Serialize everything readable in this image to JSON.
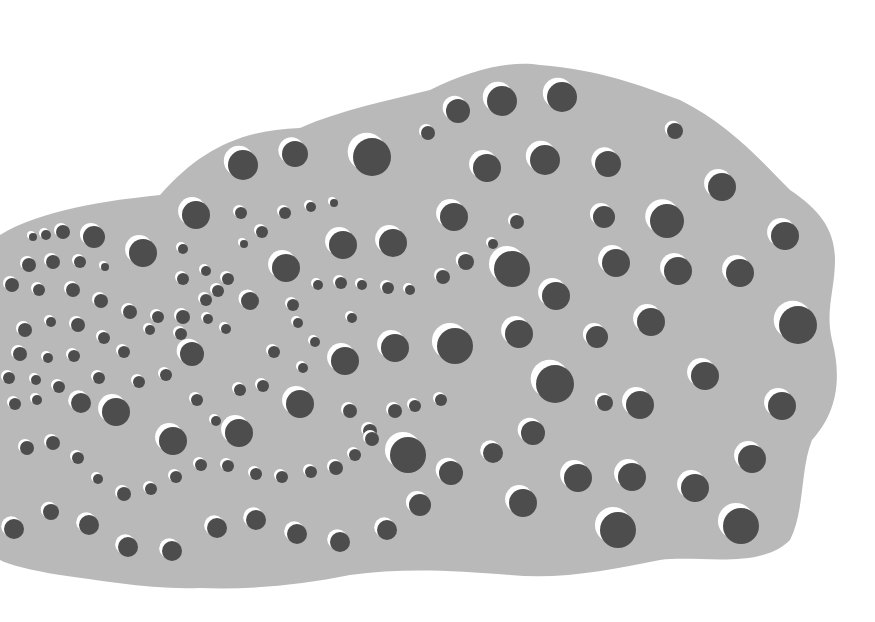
{
  "image": {
    "description": "Abstract gray cloud-shaped blob filled with dark dots, each with a white crescent highlight offset to the upper-left",
    "colors": {
      "background": "#ffffff",
      "blob": "#b9b9b9",
      "dot": "#4d4d4d",
      "highlight": "#ffffff"
    }
  },
  "dots": [
    [
      243,
      165,
      15
    ],
    [
      295,
      154,
      13
    ],
    [
      372,
      157,
      19
    ],
    [
      458,
      111,
      12
    ],
    [
      502,
      101,
      15
    ],
    [
      562,
      97,
      15
    ],
    [
      675,
      131,
      8
    ],
    [
      428,
      133,
      7
    ],
    [
      487,
      168,
      14
    ],
    [
      545,
      160,
      15
    ],
    [
      608,
      164,
      13
    ],
    [
      722,
      187,
      14
    ],
    [
      785,
      236,
      14
    ],
    [
      196,
      215,
      14
    ],
    [
      94,
      237,
      11
    ],
    [
      143,
      253,
      14
    ],
    [
      241,
      213,
      6
    ],
    [
      285,
      213,
      6
    ],
    [
      311,
      207,
      5
    ],
    [
      334,
      203,
      4
    ],
    [
      454,
      217,
      14
    ],
    [
      517,
      222,
      7
    ],
    [
      604,
      217,
      11
    ],
    [
      667,
      221,
      17
    ],
    [
      33,
      237,
      4
    ],
    [
      46,
      235,
      5
    ],
    [
      63,
      232,
      7
    ],
    [
      343,
      245,
      14
    ],
    [
      393,
      243,
      14
    ],
    [
      493,
      244,
      5
    ],
    [
      512,
      269,
      18
    ],
    [
      616,
      263,
      14
    ],
    [
      678,
      271,
      14
    ],
    [
      740,
      273,
      14
    ],
    [
      286,
      268,
      14
    ],
    [
      244,
      244,
      4
    ],
    [
      262,
      232,
      6
    ],
    [
      183,
      249,
      5
    ],
    [
      183,
      279,
      6
    ],
    [
      206,
      271,
      5
    ],
    [
      228,
      279,
      6
    ],
    [
      29,
      265,
      7
    ],
    [
      53,
      262,
      7
    ],
    [
      80,
      262,
      6
    ],
    [
      105,
      267,
      4
    ],
    [
      12,
      285,
      7
    ],
    [
      39,
      290,
      6
    ],
    [
      73,
      290,
      7
    ],
    [
      101,
      301,
      7
    ],
    [
      130,
      312,
      7
    ],
    [
      158,
      317,
      6
    ],
    [
      183,
      317,
      7
    ],
    [
      206,
      300,
      6
    ],
    [
      218,
      291,
      6
    ],
    [
      250,
      301,
      9
    ],
    [
      293,
      305,
      6
    ],
    [
      318,
      285,
      5
    ],
    [
      341,
      283,
      6
    ],
    [
      362,
      285,
      5
    ],
    [
      388,
      288,
      6
    ],
    [
      410,
      290,
      5
    ],
    [
      443,
      277,
      7
    ],
    [
      466,
      262,
      8
    ],
    [
      556,
      296,
      14
    ],
    [
      798,
      325,
      19
    ],
    [
      651,
      322,
      14
    ],
    [
      597,
      337,
      11
    ],
    [
      519,
      334,
      14
    ],
    [
      455,
      346,
      18
    ],
    [
      395,
      348,
      14
    ],
    [
      345,
      361,
      14
    ],
    [
      298,
      323,
      5
    ],
    [
      352,
      318,
      5
    ],
    [
      226,
      329,
      5
    ],
    [
      208,
      319,
      5
    ],
    [
      181,
      334,
      6
    ],
    [
      192,
      354,
      12
    ],
    [
      25,
      330,
      7
    ],
    [
      51,
      322,
      5
    ],
    [
      78,
      325,
      7
    ],
    [
      104,
      338,
      6
    ],
    [
      20,
      354,
      7
    ],
    [
      48,
      358,
      5
    ],
    [
      74,
      356,
      6
    ],
    [
      150,
      330,
      5
    ],
    [
      124,
      352,
      6
    ],
    [
      274,
      352,
      6
    ],
    [
      303,
      368,
      5
    ],
    [
      315,
      342,
      5
    ],
    [
      9,
      378,
      6
    ],
    [
      36,
      380,
      5
    ],
    [
      59,
      387,
      6
    ],
    [
      99,
      378,
      6
    ],
    [
      139,
      382,
      6
    ],
    [
      166,
      375,
      6
    ],
    [
      197,
      400,
      6
    ],
    [
      240,
      390,
      6
    ],
    [
      263,
      386,
      6
    ],
    [
      300,
      404,
      14
    ],
    [
      350,
      411,
      7
    ],
    [
      370,
      431,
      7
    ],
    [
      395,
      411,
      7
    ],
    [
      415,
      406,
      6
    ],
    [
      441,
      400,
      6
    ],
    [
      408,
      455,
      18
    ],
    [
      555,
      384,
      19
    ],
    [
      605,
      403,
      8
    ],
    [
      640,
      405,
      14
    ],
    [
      705,
      376,
      14
    ],
    [
      782,
      406,
      14
    ],
    [
      533,
      433,
      12
    ],
    [
      493,
      453,
      10
    ],
    [
      752,
      459,
      14
    ],
    [
      15,
      404,
      6
    ],
    [
      37,
      400,
      5
    ],
    [
      81,
      403,
      10
    ],
    [
      116,
      412,
      14
    ],
    [
      173,
      441,
      14
    ],
    [
      239,
      433,
      14
    ],
    [
      216,
      421,
      5
    ],
    [
      27,
      448,
      7
    ],
    [
      53,
      443,
      7
    ],
    [
      78,
      458,
      6
    ],
    [
      98,
      479,
      5
    ],
    [
      124,
      494,
      7
    ],
    [
      151,
      489,
      6
    ],
    [
      176,
      477,
      6
    ],
    [
      201,
      465,
      6
    ],
    [
      228,
      466,
      6
    ],
    [
      256,
      474,
      6
    ],
    [
      282,
      477,
      6
    ],
    [
      311,
      472,
      6
    ],
    [
      336,
      468,
      7
    ],
    [
      355,
      455,
      6
    ],
    [
      372,
      439,
      7
    ],
    [
      451,
      473,
      12
    ],
    [
      578,
      478,
      14
    ],
    [
      632,
      477,
      14
    ],
    [
      695,
      488,
      14
    ],
    [
      523,
      503,
      14
    ],
    [
      420,
      505,
      11
    ],
    [
      618,
      530,
      18
    ],
    [
      741,
      526,
      18
    ],
    [
      14,
      529,
      10
    ],
    [
      51,
      512,
      8
    ],
    [
      89,
      525,
      10
    ],
    [
      128,
      547,
      10
    ],
    [
      172,
      551,
      10
    ],
    [
      217,
      528,
      10
    ],
    [
      256,
      520,
      10
    ],
    [
      297,
      534,
      10
    ],
    [
      340,
      542,
      10
    ],
    [
      387,
      530,
      10
    ]
  ]
}
